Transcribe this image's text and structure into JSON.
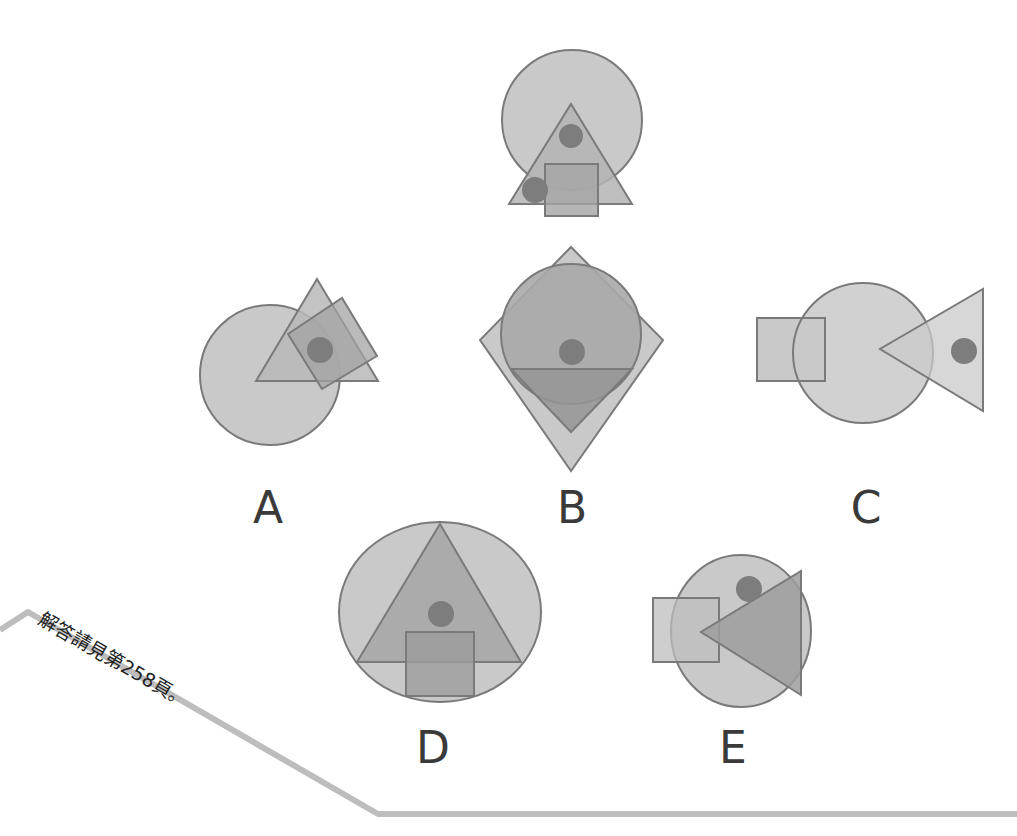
{
  "puzzle": {
    "question_figure": {
      "name": "reference-figure"
    },
    "options": [
      {
        "label": "A"
      },
      {
        "label": "B"
      },
      {
        "label": "C"
      },
      {
        "label": "D"
      },
      {
        "label": "E"
      }
    ],
    "answer_note": "解答請見第258頁。"
  },
  "colors": {
    "light_fill": "#c9c9c9",
    "mid_fill": "#ababab",
    "dark_fill": "#8f8f8f",
    "dot_fill": "#7d7d7d",
    "stroke": "#7a7a7a",
    "label_text": "#3a3a3a",
    "frame_line": "#bdbdbd"
  }
}
